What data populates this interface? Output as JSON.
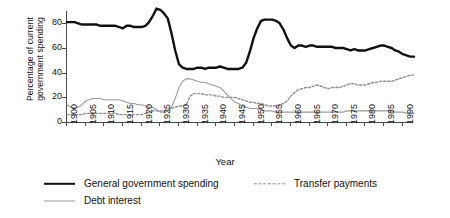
{
  "chart_data": {
    "type": "line",
    "title": "",
    "xlabel": "Year",
    "ylabel_line1": "Percentage of current",
    "ylabel_line2": "government spending",
    "ylabel": "Percentage of current government spending",
    "xlim": [
      1900,
      1993
    ],
    "ylim": [
      0,
      90
    ],
    "yticks": [
      0,
      20,
      40,
      60,
      80
    ],
    "xticks": [
      1900,
      1905,
      1910,
      1915,
      1920,
      1925,
      1930,
      1935,
      1940,
      1945,
      1950,
      1955,
      1960,
      1965,
      1970,
      1975,
      1980,
      1985,
      1990
    ],
    "grid": false,
    "legend_position": "bottom",
    "colors": {
      "general_government_spending": "#111111",
      "transfer_payments": "#8e8e8e",
      "debt_interest": "#9a9a9a"
    },
    "x": [
      1900,
      1901,
      1902,
      1903,
      1904,
      1905,
      1906,
      1907,
      1908,
      1909,
      1910,
      1911,
      1912,
      1913,
      1914,
      1915,
      1916,
      1917,
      1918,
      1919,
      1920,
      1921,
      1922,
      1923,
      1924,
      1925,
      1926,
      1927,
      1928,
      1929,
      1930,
      1931,
      1932,
      1933,
      1934,
      1935,
      1936,
      1937,
      1938,
      1939,
      1940,
      1941,
      1942,
      1943,
      1944,
      1945,
      1946,
      1947,
      1948,
      1949,
      1950,
      1951,
      1952,
      1953,
      1954,
      1955,
      1956,
      1957,
      1958,
      1959,
      1960,
      1961,
      1962,
      1963,
      1964,
      1965,
      1966,
      1967,
      1968,
      1969,
      1970,
      1971,
      1972,
      1973,
      1974,
      1975,
      1976,
      1977,
      1978,
      1979,
      1980,
      1981,
      1982,
      1983,
      1984,
      1985,
      1986,
      1987,
      1988,
      1989,
      1990,
      1991,
      1992,
      1993
    ],
    "series": [
      {
        "name": "General government spending",
        "style": "solid",
        "width": 2.4,
        "color": "#111111",
        "values": [
          81,
          81,
          81,
          80,
          79,
          79,
          79,
          79,
          79,
          78,
          78,
          78,
          78,
          78,
          77,
          76,
          78,
          78,
          77,
          77,
          77,
          78,
          81,
          86,
          92,
          91,
          88,
          84,
          72,
          58,
          47,
          44,
          43,
          43,
          43,
          44,
          44,
          43,
          44,
          44,
          44,
          45,
          44,
          43,
          43,
          43,
          43,
          44,
          48,
          57,
          68,
          76,
          82,
          83,
          83,
          83,
          82,
          80,
          75,
          68,
          62,
          60,
          62,
          62,
          61,
          62,
          62,
          61,
          61,
          61,
          61,
          61,
          60,
          60,
          60,
          59,
          58,
          59,
          58,
          58,
          58,
          59,
          60,
          61,
          62,
          62,
          61,
          60,
          58,
          57,
          55,
          54,
          53,
          53
        ]
      },
      {
        "name": "Transfer payments",
        "style": "dashed",
        "width": 1.4,
        "color": "#8e8e8e",
        "values": [
          6,
          6,
          6,
          6,
          6,
          7,
          7,
          7,
          7,
          7,
          7,
          7,
          7,
          7,
          6,
          6,
          6,
          6,
          6,
          6,
          6,
          7,
          8,
          9,
          9,
          9,
          9,
          9,
          11,
          12,
          13,
          13,
          14,
          21,
          23,
          23,
          23,
          22,
          22,
          22,
          21,
          21,
          20,
          20,
          20,
          20,
          19,
          18,
          17,
          16,
          16,
          15,
          15,
          14,
          13,
          13,
          13,
          14,
          15,
          17,
          21,
          24,
          26,
          27,
          28,
          28,
          29,
          30,
          29,
          28,
          27,
          28,
          28,
          28,
          29,
          30,
          31,
          31,
          30,
          30,
          30,
          31,
          32,
          32,
          33,
          33,
          33,
          33,
          34,
          35,
          36,
          37,
          38,
          38
        ]
      },
      {
        "name": "Debt interest",
        "style": "solid",
        "width": 1.1,
        "color": "#9a9a9a",
        "values": [
          14,
          12,
          11,
          12,
          14,
          17,
          18,
          19,
          19,
          19,
          18,
          18,
          18,
          18,
          18,
          17,
          16,
          15,
          15,
          14,
          14,
          13,
          12,
          12,
          10,
          8,
          8,
          10,
          12,
          19,
          28,
          33,
          35,
          35,
          34,
          33,
          32,
          32,
          31,
          30,
          29,
          28,
          25,
          22,
          19,
          16,
          15,
          13,
          12,
          11,
          11,
          11,
          10,
          9,
          9,
          9,
          8,
          8,
          8,
          8,
          8,
          8,
          8,
          8,
          8,
          8,
          8,
          8,
          8,
          8,
          8,
          8,
          8,
          8,
          8,
          9,
          9,
          9,
          9,
          9,
          9,
          9,
          9,
          9,
          9,
          9,
          9,
          9,
          8,
          8,
          8,
          7,
          7,
          7
        ]
      }
    ]
  },
  "legend": {
    "items": [
      {
        "label": "General government spending",
        "swatch": "sw-solid-thick"
      },
      {
        "label": "Transfer payments",
        "swatch": "sw-dashed"
      },
      {
        "label": "Debt interest",
        "swatch": "sw-solid-thin"
      }
    ]
  }
}
